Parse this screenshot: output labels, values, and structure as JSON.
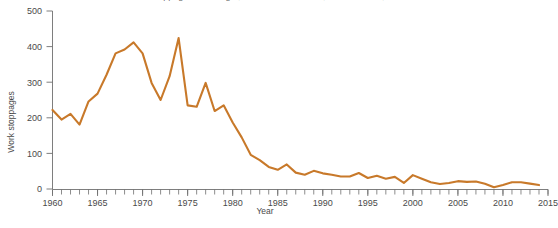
{
  "chart_data": {
    "type": "line",
    "title": "Work stoppages involving 1,000 or more workers, United States, 1960-2014",
    "title_visible": false,
    "xlabel": "Year",
    "ylabel": "Work stoppages",
    "xlim": [
      1960,
      2015
    ],
    "ylim": [
      0,
      500
    ],
    "grid": false,
    "legend": "none",
    "y_ticks": [
      0,
      100,
      200,
      300,
      400,
      500
    ],
    "y_tick_labels": [
      "0",
      "100",
      "200",
      "300",
      "400",
      "500"
    ],
    "x_ticks": [
      1960,
      1965,
      1970,
      1975,
      1980,
      1985,
      1990,
      1995,
      2000,
      2005,
      2010,
      2015
    ],
    "x_tick_labels": [
      "1960",
      "1965",
      "1970",
      "1975",
      "1980",
      "1985",
      "1990",
      "1995",
      "2000",
      "2005",
      "2010",
      "2015"
    ],
    "x_minor_tick_step": 1,
    "series": [
      {
        "name": "Work stoppages",
        "color": "#C8792A",
        "x": [
          1960,
          1961,
          1962,
          1963,
          1964,
          1965,
          1966,
          1967,
          1968,
          1969,
          1970,
          1971,
          1972,
          1973,
          1974,
          1975,
          1976,
          1977,
          1978,
          1979,
          1980,
          1981,
          1982,
          1983,
          1984,
          1985,
          1986,
          1987,
          1988,
          1989,
          1990,
          1991,
          1992,
          1993,
          1994,
          1995,
          1996,
          1997,
          1998,
          1999,
          2000,
          2001,
          2002,
          2003,
          2004,
          2005,
          2006,
          2007,
          2008,
          2009,
          2010,
          2011,
          2012,
          2013,
          2014
        ],
        "values": [
          222,
          195,
          211,
          181,
          246,
          268,
          321,
          381,
          392,
          412,
          381,
          298,
          250,
          317,
          424,
          235,
          231,
          298,
          219,
          235,
          187,
          145,
          96,
          81,
          62,
          54,
          69,
          46,
          40,
          51,
          44,
          40,
          35,
          35,
          45,
          31,
          37,
          29,
          34,
          17,
          39,
          29,
          19,
          14,
          17,
          22,
          20,
          21,
          15,
          5,
          11,
          19,
          19,
          15,
          11
        ],
        "units": "number of major work stoppages beginning in year"
      }
    ]
  },
  "plot": {
    "axis_color": "#6f6f6f",
    "background": "#ffffff"
  }
}
